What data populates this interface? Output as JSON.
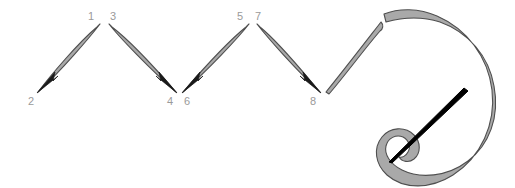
{
  "diagram": {
    "type": "instructional-stitch-diagram",
    "canvas": {
      "width": 515,
      "height": 188,
      "background": "#ffffff"
    },
    "colors": {
      "stitch_fill": "#a9a9a9",
      "stitch_outline": "#4f4f4f",
      "thread_fill": "#a9a9a9",
      "thread_outline": "#4f4f4f",
      "arrowhead": "#1a1a1a",
      "needle": "#000000",
      "label_text": "#9a9a9a",
      "background": "#ffffff"
    },
    "point_labels": [
      {
        "id": "label-1",
        "text": "1",
        "x": 91,
        "y": 20,
        "position": "top",
        "vertex": "peak-1"
      },
      {
        "id": "label-3",
        "text": "3",
        "x": 113,
        "y": 20,
        "position": "top",
        "vertex": "peak-1"
      },
      {
        "id": "label-2",
        "text": "2",
        "x": 31,
        "y": 105,
        "position": "bottom",
        "vertex": "valley-0"
      },
      {
        "id": "label-4",
        "text": "4",
        "x": 170,
        "y": 105,
        "position": "bottom",
        "vertex": "valley-1"
      },
      {
        "id": "label-6",
        "text": "6",
        "x": 187,
        "y": 105,
        "position": "bottom",
        "vertex": "valley-1"
      },
      {
        "id": "label-5",
        "text": "5",
        "x": 240,
        "y": 20,
        "position": "top",
        "vertex": "peak-2"
      },
      {
        "id": "label-7",
        "text": "7",
        "x": 258,
        "y": 20,
        "position": "top",
        "vertex": "peak-2"
      },
      {
        "id": "label-8",
        "text": "8",
        "x": 313,
        "y": 105,
        "position": "bottom",
        "vertex": "valley-2"
      }
    ],
    "stitches": [
      {
        "id": "stitch-1",
        "from_label": "1",
        "to_label": "2",
        "direction": "down-left",
        "arrow_at": "2"
      },
      {
        "id": "stitch-2",
        "from_label": "3",
        "to_label": "4",
        "direction": "down-right",
        "arrow_at": "4"
      },
      {
        "id": "stitch-3",
        "from_label": "5",
        "to_label": "6",
        "direction": "down-left",
        "arrow_at": "6"
      },
      {
        "id": "stitch-4",
        "from_label": "7",
        "to_label": "8",
        "direction": "down-right",
        "arrow_at": "8"
      },
      {
        "id": "stitch-5",
        "from_label": "",
        "to_label": "",
        "direction": "up-right",
        "arrow_at": "none"
      }
    ],
    "thread": {
      "id": "thread-loop",
      "description": "long working thread curving from last stitch into a large C loop ending in a curled tail"
    },
    "needle": {
      "id": "needle",
      "description": "black tapered sewing needle passing through the thread loop",
      "angle_degrees": -42
    }
  }
}
